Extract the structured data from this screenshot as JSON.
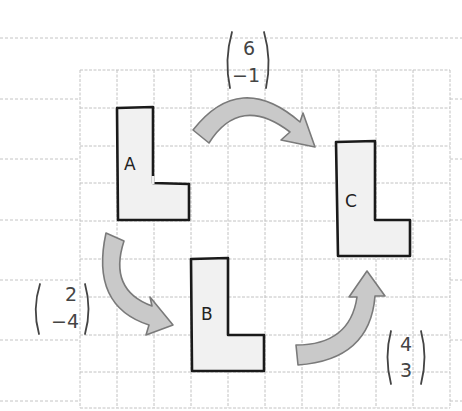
{
  "diagram": {
    "grid": {
      "columns": 10,
      "rows": 9
    },
    "shapes": [
      {
        "label": "A",
        "cells_note": "L-shape at top-left"
      },
      {
        "label": "B",
        "cells_note": "L-shape at bottom-middle"
      },
      {
        "label": "C",
        "cells_note": "L-shape at right"
      }
    ],
    "translations": [
      {
        "from": "A",
        "to": "C",
        "vector": {
          "top": "6",
          "bottom": "−1"
        }
      },
      {
        "from": "A",
        "to": "B",
        "vector": {
          "top": "2",
          "bottom": "−4"
        }
      },
      {
        "from": "B",
        "to": "C",
        "vector": {
          "top": "4",
          "bottom": "3"
        }
      }
    ]
  }
}
